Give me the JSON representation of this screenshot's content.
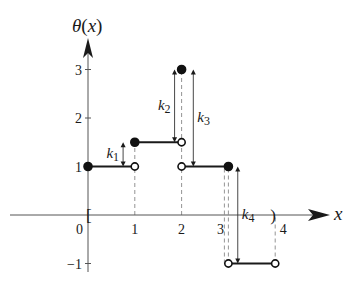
{
  "chart_data": {
    "type": "line",
    "title": "",
    "ylabel": "θ(x)",
    "xlabel": "x",
    "xlim": [
      0,
      4
    ],
    "ylim": [
      -1,
      3
    ],
    "x_ticks": [
      {
        "value": 0,
        "label": "0"
      },
      {
        "value": 1,
        "label": "1"
      },
      {
        "value": 2,
        "label": "2"
      },
      {
        "value": 3,
        "label": "3"
      },
      {
        "value": 4,
        "label": "4"
      }
    ],
    "y_ticks": [
      {
        "value": -1,
        "label": "−1"
      },
      {
        "value": 1,
        "label": "1"
      },
      {
        "value": 2,
        "label": "2"
      },
      {
        "value": 3,
        "label": "3"
      }
    ],
    "domain_brackets": {
      "left": "[",
      "right": ")",
      "left_value": 0,
      "right_value": 4
    },
    "segments": [
      {
        "x0": 0,
        "x1": 1,
        "y": 1,
        "start_closed": true,
        "end_closed": false
      },
      {
        "x0": 1,
        "x1": 2,
        "y": 1.5,
        "start_closed": true,
        "end_closed": false
      },
      {
        "x0": 2,
        "x1": 3,
        "y": 1,
        "start_closed": false,
        "end_closed": true
      },
      {
        "x0": 3,
        "x1": 4,
        "y": -1,
        "start_closed": false,
        "end_closed": false
      }
    ],
    "isolated_points": [
      {
        "x": 2,
        "y": 3,
        "closed": true
      }
    ],
    "guides": [
      {
        "x": 1,
        "y_from": 0,
        "y_to": 1.5
      },
      {
        "x": 2,
        "y_from": 0,
        "y_to": 3
      },
      {
        "x": 3,
        "y_from": -1,
        "y_to": 1
      },
      {
        "x": 4,
        "y_from": -1,
        "y_to": 0
      }
    ],
    "jumps": [
      {
        "label": "k",
        "sub": "1",
        "x": 0.75,
        "y_from": 1,
        "y_to": 1.5
      },
      {
        "label": "k",
        "sub": "2",
        "x": 1.85,
        "y_from": 1.5,
        "y_to": 3
      },
      {
        "label": "k",
        "sub": "3",
        "x": 2.25,
        "y_from": 3,
        "y_to": 1
      },
      {
        "label": "k",
        "sub": "4",
        "x": 3.2,
        "y_from": 1,
        "y_to": -1
      }
    ]
  }
}
